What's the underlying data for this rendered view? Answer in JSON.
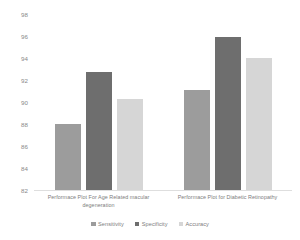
{
  "chart_data": {
    "type": "bar",
    "title": "",
    "subtitle": "",
    "xlabel": "",
    "ylabel": "",
    "ylim": [
      82,
      98
    ],
    "yticks": [
      82,
      84,
      86,
      88,
      90,
      92,
      94,
      96,
      98
    ],
    "grid": false,
    "legend_position": "bottom-center",
    "categories": [
      "Performace Plot For Age Related macular degeneration",
      "Performace Plot for Diabetic Retinopathy"
    ],
    "series": [
      {
        "name": "Sensitivity",
        "color": "#9c9c9c",
        "values": [
          88.0,
          91.1
        ]
      },
      {
        "name": "Specificity",
        "color": "#6e6e6e",
        "values": [
          92.7,
          95.9
        ]
      },
      {
        "name": "Accuracy",
        "color": "#d6d6d6",
        "values": [
          90.3,
          94.0
        ]
      }
    ]
  },
  "legend": {
    "items": [
      {
        "label": "Sensitivity",
        "color": "#9c9c9c"
      },
      {
        "label": "Specificity",
        "color": "#6e6e6e"
      },
      {
        "label": "Accuracy",
        "color": "#d6d6d6"
      }
    ]
  },
  "axis": {
    "y_tick_labels": [
      "98",
      "96",
      "94",
      "92",
      "90",
      "88",
      "86",
      "84",
      "82"
    ]
  }
}
